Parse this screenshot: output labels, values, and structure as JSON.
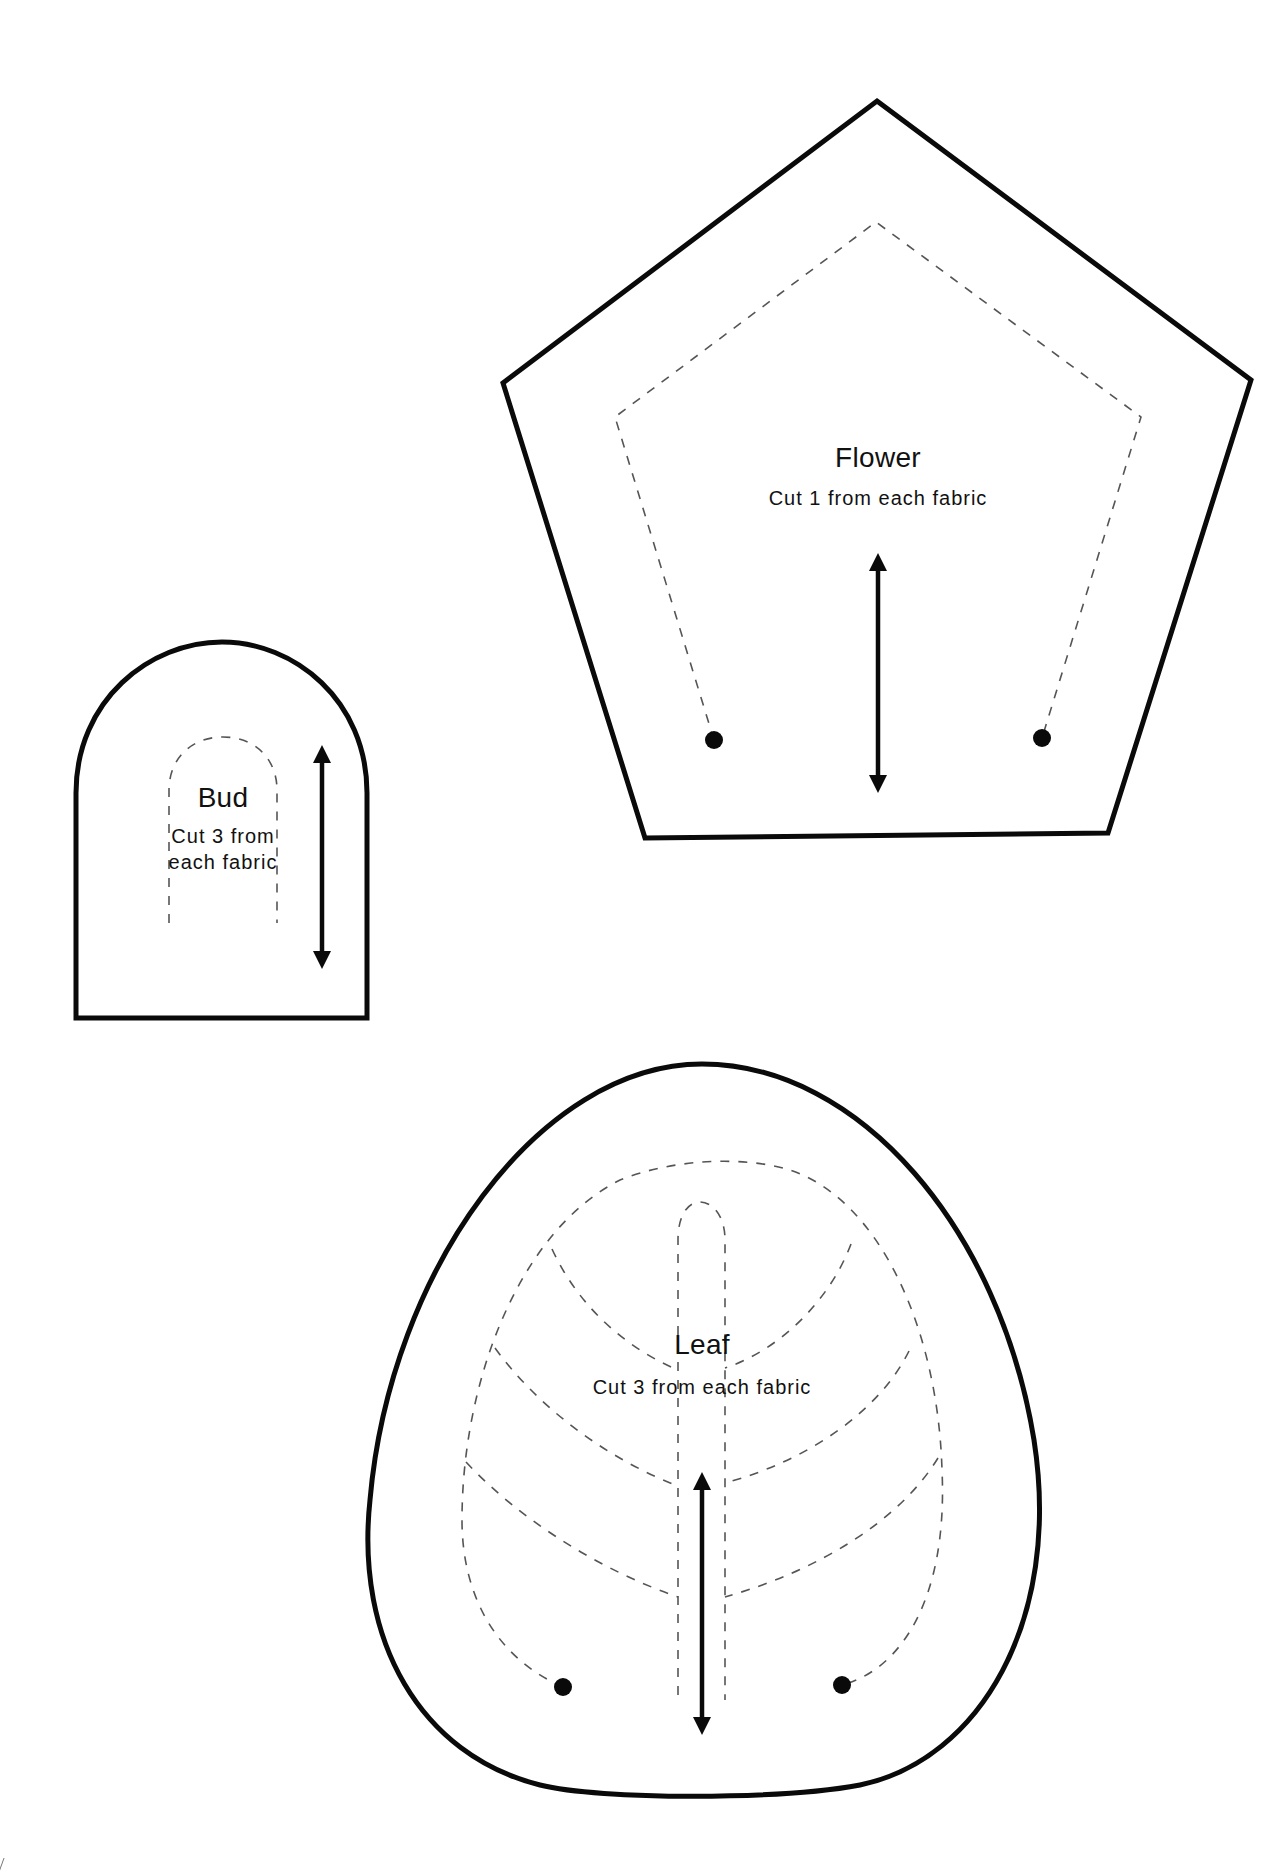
{
  "pieces": {
    "flower": {
      "title": "Flower",
      "instruction": "Cut 1 from each fabric"
    },
    "bud": {
      "title": "Bud",
      "instruction_line1": "Cut 3 from",
      "instruction_line2": "each fabric"
    },
    "leaf": {
      "title": "Leaf",
      "instruction": "Cut 3 from each fabric"
    }
  },
  "legend": {
    "outline": "cutting-line",
    "dashed": "stitching-line",
    "arrow": "grain-line-arrow",
    "dot": "stop-stitching-dot"
  },
  "colors": {
    "line": "#0a0a0a",
    "dashed": "#555555",
    "background": "#ffffff"
  }
}
